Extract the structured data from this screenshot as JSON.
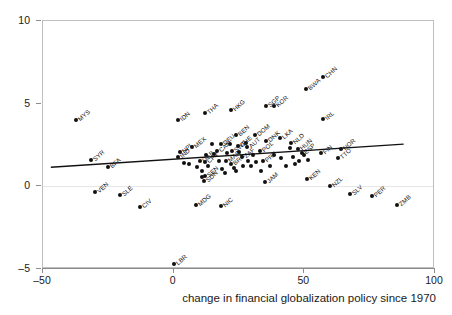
{
  "chart_data": {
    "type": "scatter",
    "title": "",
    "xlabel": "change in financial globalization policy since 1970",
    "ylabel": "",
    "xlim": [
      -50,
      100
    ],
    "ylim": [
      -5,
      10
    ],
    "xticks": [
      -50,
      0,
      50,
      100
    ],
    "yticks": [
      -5,
      0,
      5,
      10
    ],
    "xtick_labels": [
      "–50",
      "0",
      "50",
      "100"
    ],
    "ytick_labels": [
      "–5",
      "0",
      "5",
      "10"
    ],
    "grid": false,
    "legend": null,
    "zero_line": true,
    "trend_line": {
      "x_start": -47,
      "y_start": 1.15,
      "x_end": 88,
      "y_end": 2.55,
      "color": "#111111"
    },
    "point_color": "#111111",
    "label_rotation_deg": -42,
    "points": [
      {
        "label": "MYS",
        "x": -37.5,
        "y": 4.0
      },
      {
        "label": "SYR",
        "x": -31.5,
        "y": 1.6
      },
      {
        "label": "BFA",
        "x": -25.0,
        "y": 1.15
      },
      {
        "label": "VEN",
        "x": -30.0,
        "y": -0.35
      },
      {
        "label": "SLE",
        "x": -20.5,
        "y": -0.5
      },
      {
        "label": "CIV",
        "x": -13.0,
        "y": -1.25
      },
      {
        "label": "IDN",
        "x": 1.5,
        "y": 4.0
      },
      {
        "label": "THA",
        "x": 12.0,
        "y": 4.45
      },
      {
        "label": "HKG",
        "x": 22.0,
        "y": 4.6
      },
      {
        "label": "SGP",
        "x": 35.5,
        "y": 4.85
      },
      {
        "label": "KOR",
        "x": 38.5,
        "y": 4.85
      },
      {
        "label": "BWA",
        "x": 50.5,
        "y": 5.9
      },
      {
        "label": "CHN",
        "x": 57.0,
        "y": 6.6
      },
      {
        "label": "IRL",
        "x": 57.0,
        "y": 4.1
      },
      {
        "label": "BEN",
        "x": 24.0,
        "y": 3.1
      },
      {
        "label": "DNK",
        "x": 35.5,
        "y": 2.75
      },
      {
        "label": "DEU",
        "x": 18.0,
        "y": 2.55
      },
      {
        "label": "MEX",
        "x": 7.0,
        "y": 2.4
      },
      {
        "label": "NPL",
        "x": 2.5,
        "y": 2.1
      },
      {
        "label": "IND",
        "x": 1.5,
        "y": 1.8
      },
      {
        "label": "DOM",
        "x": 31.0,
        "y": 3.1
      },
      {
        "label": "LKA",
        "x": 40.5,
        "y": 2.9
      },
      {
        "label": "CAN",
        "x": 16.5,
        "y": 2.15
      },
      {
        "label": "GAB",
        "x": 10.0,
        "y": 1.55
      },
      {
        "label": "CPV",
        "x": 12.0,
        "y": 1.45
      },
      {
        "label": "SEN",
        "x": 12.0,
        "y": 0.65
      },
      {
        "label": "SDN",
        "x": 11.5,
        "y": 0.35
      },
      {
        "label": "SWE",
        "x": 22.5,
        "y": 2.15
      },
      {
        "label": "CHE",
        "x": 24.5,
        "y": 2.45
      },
      {
        "label": "AUT",
        "x": 28.0,
        "y": 2.35
      },
      {
        "label": "POL",
        "x": 33.0,
        "y": 2.15
      },
      {
        "label": "MAR",
        "x": 20.0,
        "y": 1.55
      },
      {
        "label": "BRA",
        "x": 22.0,
        "y": 1.35
      },
      {
        "label": "ZAF",
        "x": 26.0,
        "y": 1.75
      },
      {
        "label": "PRY",
        "x": 34.0,
        "y": 1.55
      },
      {
        "label": "NLD",
        "x": 45.0,
        "y": 2.6
      },
      {
        "label": "HUN",
        "x": 47.5,
        "y": 2.25
      },
      {
        "label": "ESP",
        "x": 49.0,
        "y": 2.0
      },
      {
        "label": "FIN",
        "x": 56.5,
        "y": 2.0
      },
      {
        "label": "NOR",
        "x": 64.0,
        "y": 2.25
      },
      {
        "label": "TTO",
        "x": 63.0,
        "y": 1.7
      },
      {
        "label": "JAM",
        "x": 35.0,
        "y": 0.25
      },
      {
        "label": "KEN",
        "x": 51.0,
        "y": 0.45
      },
      {
        "label": "NZL",
        "x": 60.0,
        "y": 0.0
      },
      {
        "label": "SLV",
        "x": 67.5,
        "y": -0.45
      },
      {
        "label": "PER",
        "x": 76.0,
        "y": -0.6
      },
      {
        "label": "ZMB",
        "x": 85.5,
        "y": -1.15
      },
      {
        "label": "MDG",
        "x": 8.5,
        "y": -1.15
      },
      {
        "label": "NIC",
        "x": 18.0,
        "y": -1.2
      },
      {
        "label": "LBR",
        "x": 0.0,
        "y": -4.7
      },
      {
        "label": "",
        "x": 14.5,
        "y": 2.55
      },
      {
        "label": "",
        "x": 15.5,
        "y": 1.95
      },
      {
        "label": "",
        "x": 17.5,
        "y": 1.55
      },
      {
        "label": "",
        "x": 18.5,
        "y": 1.05
      },
      {
        "label": "",
        "x": 19.5,
        "y": 0.8
      },
      {
        "label": "",
        "x": 20.5,
        "y": 2.0
      },
      {
        "label": "",
        "x": 21.5,
        "y": 2.55
      },
      {
        "label": "",
        "x": 23.0,
        "y": 1.1
      },
      {
        "label": "",
        "x": 24.0,
        "y": 0.9
      },
      {
        "label": "",
        "x": 25.0,
        "y": 2.05
      },
      {
        "label": "",
        "x": 26.5,
        "y": 1.2
      },
      {
        "label": "",
        "x": 27.5,
        "y": 2.6
      },
      {
        "label": "",
        "x": 28.5,
        "y": 1.55
      },
      {
        "label": "",
        "x": 29.5,
        "y": 1.25
      },
      {
        "label": "",
        "x": 30.5,
        "y": 1.9
      },
      {
        "label": "",
        "x": 31.5,
        "y": 1.45
      },
      {
        "label": "",
        "x": 13.0,
        "y": 1.2
      },
      {
        "label": "",
        "x": 12.5,
        "y": 1.9
      },
      {
        "label": "",
        "x": 9.0,
        "y": 1.15
      },
      {
        "label": "",
        "x": 6.0,
        "y": 1.35
      },
      {
        "label": "",
        "x": 4.0,
        "y": 1.4
      },
      {
        "label": "",
        "x": 45.5,
        "y": 1.8
      },
      {
        "label": "",
        "x": 46.5,
        "y": 1.35
      },
      {
        "label": "",
        "x": 48.0,
        "y": 1.55
      },
      {
        "label": "",
        "x": 50.0,
        "y": 1.9
      },
      {
        "label": "",
        "x": 51.5,
        "y": 1.6
      },
      {
        "label": "",
        "x": 43.0,
        "y": 1.25
      },
      {
        "label": "",
        "x": 44.5,
        "y": 2.3
      },
      {
        "label": "",
        "x": 37.0,
        "y": 1.25
      },
      {
        "label": "",
        "x": 38.5,
        "y": 1.9
      },
      {
        "label": "",
        "x": 41.0,
        "y": 1.7
      },
      {
        "label": "",
        "x": 33.5,
        "y": 0.9
      },
      {
        "label": "",
        "x": 11.0,
        "y": 0.55
      },
      {
        "label": "",
        "x": 11.0,
        "y": 0.9
      }
    ]
  }
}
